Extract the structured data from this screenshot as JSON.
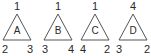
{
  "triangles": [
    {
      "label": "A",
      "top": "1",
      "bottom_left": "2",
      "bottom_right": "3"
    },
    {
      "label": "B",
      "top": "1",
      "bottom_left": "3",
      "bottom_right": "4"
    },
    {
      "label": "C",
      "top": "1",
      "bottom_left": "4",
      "bottom_right": "2"
    },
    {
      "label": "D",
      "top": "4",
      "bottom_left": "3",
      "bottom_right": "2"
    }
  ]
}
